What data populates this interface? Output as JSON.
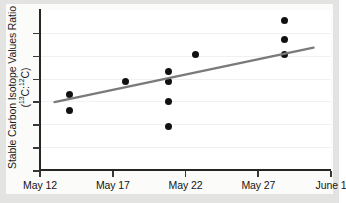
{
  "chart_data": {
    "type": "scatter",
    "title": "",
    "xlabel": "",
    "ylabel": "Stable Carbon Isotope Values Ratio (13C:12C)",
    "ylabel_line1": "Stable Carbon Isotope Values Ratio",
    "ylabel_line2_prefix": "(",
    "ylabel_line2_sup1": "13",
    "ylabel_line2_mid1": "C:",
    "ylabel_line2_sup2": "12",
    "ylabel_line2_suffix": "C)",
    "x_tick_labels": [
      "May 12",
      "May 17",
      "May 22",
      "May 27",
      "June 1"
    ],
    "x_tick_values": [
      0,
      5,
      10,
      15,
      20
    ],
    "xlim": [
      0,
      20
    ],
    "ylim": [
      0,
      7
    ],
    "y_tick_values": [
      0,
      1,
      2,
      3,
      4,
      5,
      6
    ],
    "y_tick_labels": [
      "",
      "",
      "",
      "",
      "",
      "",
      ""
    ],
    "grid": true,
    "legend": "none",
    "points": [
      {
        "x": 2.0,
        "y": 3.31
      },
      {
        "x": 2.0,
        "y": 2.62
      },
      {
        "x": 5.9,
        "y": 3.87
      },
      {
        "x": 8.8,
        "y": 4.31
      },
      {
        "x": 8.8,
        "y": 3.87
      },
      {
        "x": 8.8,
        "y": 3.0
      },
      {
        "x": 8.8,
        "y": 1.91
      },
      {
        "x": 10.7,
        "y": 5.06
      },
      {
        "x": 16.8,
        "y": 6.53
      },
      {
        "x": 16.8,
        "y": 5.7
      },
      {
        "x": 16.8,
        "y": 5.06
      }
    ],
    "trend_line": {
      "name": "linear fit",
      "x_start": 1.0,
      "y_start": 2.97,
      "x_end": 18.8,
      "y_end": 5.35,
      "color": "#7a7a7a"
    },
    "series_name": "Stable carbon isotope ratio observations",
    "point_color": "#111111"
  },
  "colors": {
    "background": "#e3e3e1",
    "canvas": "#fbfbfa",
    "plot_face": "#ffffff",
    "axis": "#262626",
    "marker": "#111111",
    "trend": "#7a7a7a",
    "grid": "#f1f1f0",
    "text": "#141414"
  }
}
